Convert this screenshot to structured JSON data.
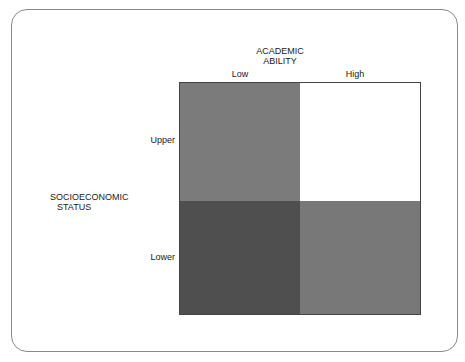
{
  "diagram": {
    "column_axis": {
      "title_line1": "ACADEMIC",
      "title_line2": "ABILITY",
      "levels": [
        "Low",
        "High"
      ]
    },
    "row_axis": {
      "title_line1": "SOCIOECONOMIC",
      "title_line2": "STATUS",
      "levels": [
        "Upper",
        "Lower"
      ]
    },
    "cells": [
      {
        "row": "Upper",
        "col": "Low",
        "color": "#7b7b7b"
      },
      {
        "row": "Upper",
        "col": "High",
        "color": "#ffffff"
      },
      {
        "row": "Lower",
        "col": "Low",
        "color": "#4f4f4f"
      },
      {
        "row": "Lower",
        "col": "High",
        "color": "#787878"
      }
    ]
  }
}
